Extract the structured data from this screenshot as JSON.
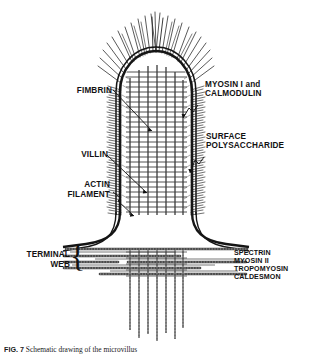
{
  "labels": {
    "fimbrin": "FIMBRIN",
    "villin": "VILLIN",
    "actin_filament_line1": "ACTIN",
    "actin_filament_line2": "FILAMENT",
    "terminal_web_line1": "TERMINAL",
    "terminal_web_line2": "WEB",
    "myosin_line1": "MYOSIN I and",
    "myosin_line2": "CALMODULIN",
    "surface_line1": "SURFACE",
    "surface_line2": "POLYSACCHARIDE",
    "web_proteins": [
      "SPECTRIN",
      "MYOSIN II",
      "TROPOMYOSIN",
      "CALDESMON"
    ],
    "bracket_glyph": "{"
  },
  "caption": {
    "lead": "FIG. 7",
    "text": "   Schematic drawing of the microvillus"
  },
  "colors": {
    "ink": "#121212",
    "membrane": "#1a1a1a",
    "filament": "#4a4a4a",
    "background": "#ffffff"
  }
}
